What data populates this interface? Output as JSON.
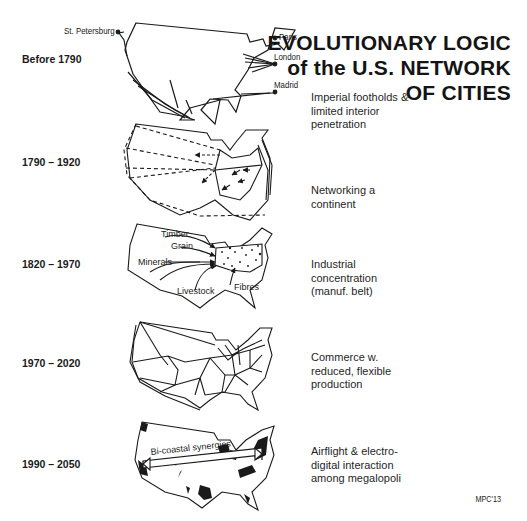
{
  "title": {
    "line1": "EVOLUTIONARY LOGIC",
    "line2": "of the U.S. NETWORK",
    "line3": "OF CITIES"
  },
  "stages": [
    {
      "period": "Before 1790",
      "description": "Imperial footholds & limited interior penetration",
      "map_labels": [
        "St. Petersburg",
        "Paris",
        "London",
        "Madrid"
      ]
    },
    {
      "period": "1790 – 1920",
      "description": "Networking a continent",
      "map_labels": []
    },
    {
      "period": "1820 – 1970",
      "description": "Industrial concentration (manuf. belt)",
      "map_labels": [
        "Timber",
        "Grain",
        "Minerals",
        "Livestock",
        "Fibres"
      ]
    },
    {
      "period": "1970 – 2020",
      "description": "Commerce w. reduced, flexible production",
      "map_labels": []
    },
    {
      "period": "1990 – 2050",
      "description": "Airflight & electro-digital interaction among megalopoli",
      "map_labels": [
        "Bi-coastal synergies"
      ]
    }
  ],
  "credit": "MPC'13"
}
